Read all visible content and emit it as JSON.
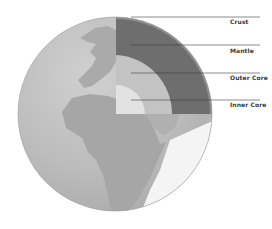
{
  "diagram": {
    "layers": [
      {
        "name": "Crust",
        "label_y": 22,
        "line_y": 17
      },
      {
        "name": "Mantle",
        "label_y": 51,
        "line_y": 45
      },
      {
        "name": "Outer Core",
        "label_y": 78,
        "line_y": 73
      },
      {
        "name": "Inner Core",
        "label_y": 105,
        "line_y": 100
      }
    ],
    "colors": {
      "ocean": "#b9b9b9",
      "land": "#a9a9a9",
      "land_light": "#d4d4d4",
      "crust": "#8e8e8e",
      "mantle": "#6e6e6e",
      "outer_core": "#c3c3c3",
      "inner_core": "#e2e2e2",
      "outline": "#9a9a9a",
      "leader_line": "#3c3c3c"
    }
  }
}
